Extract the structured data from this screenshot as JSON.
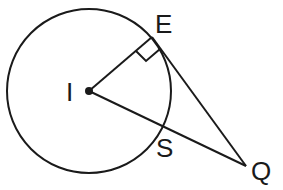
{
  "diagram": {
    "type": "geometry",
    "labels": {
      "center": "I",
      "tangent_point": "E",
      "intersection_point": "S",
      "external_point": "Q"
    },
    "points": {
      "I": {
        "x": 89,
        "y": 91
      },
      "E": {
        "x": 152,
        "y": 37
      },
      "S": {
        "x": 161,
        "y": 126
      },
      "Q": {
        "x": 246,
        "y": 166
      }
    },
    "circle": {
      "cx": 89,
      "cy": 91,
      "r": 82
    },
    "segments": [
      {
        "from": "I",
        "to": "E"
      },
      {
        "from": "E",
        "to": "Q"
      },
      {
        "from": "I",
        "to": "Q"
      }
    ],
    "right_angle_at": "E",
    "colors": {
      "ink": "#1a1a1a",
      "background": "#ffffff"
    }
  }
}
